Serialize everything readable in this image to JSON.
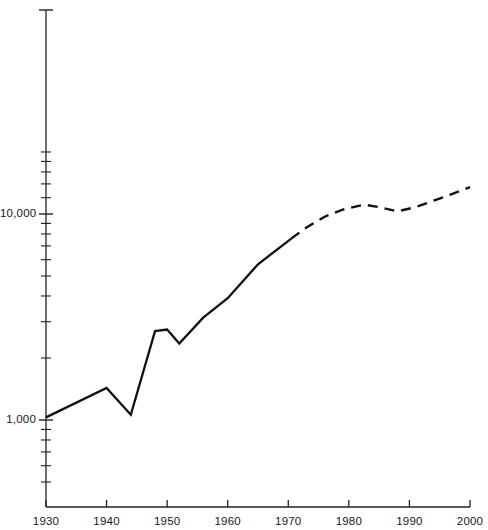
{
  "chart_data": {
    "type": "line",
    "title": "",
    "xlabel": "",
    "ylabel": "",
    "yscale": "log",
    "ylim": [
      450,
      21000
    ],
    "xlim": [
      1930,
      2000
    ],
    "grid": false,
    "legend": null,
    "y_tick_labels": [
      "10,000",
      "1,000"
    ],
    "y_tick_values": [
      10000,
      1000
    ],
    "y_minor_ticks": [
      20000,
      18000,
      16000,
      14000,
      12000,
      9000,
      8000,
      7000,
      6000,
      5000,
      4000,
      3000,
      2000,
      900,
      800,
      700,
      600,
      500
    ],
    "x_tick_labels": [
      "1930",
      "1940",
      "1950",
      "1960",
      "1970",
      "1980",
      "1990",
      "2000"
    ],
    "x_tick_values": [
      1930,
      1940,
      1950,
      1960,
      1970,
      1980,
      1990,
      2000
    ],
    "series": [
      {
        "name": "observed",
        "style": "solid",
        "color": "#111111",
        "x": [
          1930,
          1940,
          1944,
          1948,
          1950,
          1952,
          1956,
          1960,
          1965,
          1970.5
        ],
        "values": [
          1030,
          1430,
          1060,
          2700,
          2750,
          2350,
          3150,
          3900,
          5700,
          7600
        ]
      },
      {
        "name": "projected",
        "style": "dashed",
        "color": "#111111",
        "x": [
          1970.5,
          1973,
          1976,
          1979,
          1982.5,
          1985,
          1988,
          1991,
          1994,
          1997,
          2000
        ],
        "values": [
          7600,
          8600,
          9700,
          10500,
          11100,
          10800,
          10300,
          10800,
          11600,
          12500,
          13500
        ]
      }
    ]
  },
  "axes": {
    "y_axis_name": "y-axis-log-scale",
    "x_axis_name": "x-axis-years"
  }
}
